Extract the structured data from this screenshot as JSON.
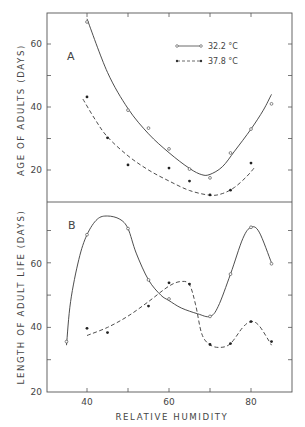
{
  "chart_data": [
    {
      "panel": "A",
      "type": "line",
      "title": "",
      "xlabel": "RELATIVE HUMIDITY",
      "ylabel": "AGE OF ADULTS (DAYS)",
      "ylim": [
        10,
        70
      ],
      "yticks": [
        20,
        30,
        40,
        50,
        60
      ],
      "ytick_labels": [
        "20",
        "",
        "40",
        "",
        "60"
      ],
      "legend_position": "upper right",
      "grid": false,
      "series": [
        {
          "name": "32.2 °C",
          "marker": "open-circle",
          "line": "solid",
          "points": [
            [
              40,
              67
            ],
            [
              50,
              39
            ],
            [
              55,
              33.3
            ],
            [
              60,
              26.7
            ],
            [
              65,
              20.3
            ],
            [
              70,
              17.5
            ],
            [
              75,
              25.4
            ],
            [
              80,
              33
            ],
            [
              85,
              41
            ]
          ],
          "curve": [
            [
              40,
              68
            ],
            [
              45,
              51
            ],
            [
              50,
              39.5
            ],
            [
              55,
              31.5
            ],
            [
              60,
              25.5
            ],
            [
              65,
              20.5
            ],
            [
              68,
              18.5
            ],
            [
              70,
              18.6
            ],
            [
              73,
              21
            ],
            [
              76,
              26
            ],
            [
              80,
              33
            ],
            [
              83,
              39
            ],
            [
              85,
              44
            ]
          ]
        },
        {
          "name": "37.8 °C",
          "marker": "filled-circle",
          "line": "dashed",
          "points": [
            [
              40,
              43.2
            ],
            [
              45,
              30.2
            ],
            [
              50,
              21.6
            ],
            [
              60,
              20.6
            ],
            [
              65,
              16.5
            ],
            [
              70,
              12.1
            ],
            [
              75,
              13.6
            ],
            [
              80,
              22.2
            ]
          ],
          "curve": [
            [
              39,
              42.5
            ],
            [
              42,
              36
            ],
            [
              45,
              30.5
            ],
            [
              50,
              24.5
            ],
            [
              55,
              20
            ],
            [
              60,
              16.5
            ],
            [
              65,
              13.5
            ],
            [
              70,
              12
            ],
            [
              73,
              12.5
            ],
            [
              76,
              14.5
            ],
            [
              79,
              18
            ],
            [
              81,
              21
            ]
          ]
        }
      ]
    },
    {
      "panel": "B",
      "type": "line",
      "title": "",
      "xlabel": "RELATIVE HUMIDITY",
      "ylabel": "LENGTH OF ADULT LIFE (DAYS)",
      "xlim": [
        30,
        90
      ],
      "xticks": [
        40,
        50,
        60,
        70,
        80
      ],
      "xtick_labels": [
        "40",
        "",
        "60",
        "",
        "80"
      ],
      "ylim": [
        20,
        79
      ],
      "yticks": [
        20,
        30,
        40,
        50,
        60,
        70
      ],
      "ytick_labels": [
        "20",
        "",
        "40",
        "",
        "60",
        ""
      ],
      "grid": false,
      "series": [
        {
          "name": "32.2 °C",
          "marker": "open-circle",
          "line": "solid",
          "points": [
            [
              35,
              35.6
            ],
            [
              40,
              68.7
            ],
            [
              50,
              70.6
            ],
            [
              55,
              54.7
            ],
            [
              60,
              48.8
            ],
            [
              70,
              43.4
            ],
            [
              75,
              56.5
            ],
            [
              80,
              71
            ],
            [
              85,
              59.7
            ]
          ],
          "curve": [
            [
              35,
              34.5
            ],
            [
              36,
              48
            ],
            [
              38,
              61
            ],
            [
              40,
              68.7
            ],
            [
              42.5,
              73.5
            ],
            [
              45,
              74.5
            ],
            [
              48,
              73.5
            ],
            [
              50,
              70.6
            ],
            [
              52,
              63
            ],
            [
              55,
              54.7
            ],
            [
              58,
              50
            ],
            [
              60,
              48.3
            ],
            [
              63,
              46
            ],
            [
              67,
              44.2
            ],
            [
              70,
              43.4
            ],
            [
              72,
              46.5
            ],
            [
              75,
              56.5
            ],
            [
              78,
              67.5
            ],
            [
              80,
              71
            ],
            [
              82,
              69.5
            ],
            [
              85,
              60
            ]
          ]
        },
        {
          "name": "37.8 °C",
          "marker": "filled-circle",
          "line": "dashed",
          "points": [
            [
              40,
              39.7
            ],
            [
              45,
              38.4
            ],
            [
              55,
              46.6
            ],
            [
              60,
              53.8
            ],
            [
              65,
              53.4
            ],
            [
              70,
              34.7
            ],
            [
              75,
              35
            ],
            [
              80,
              41.8
            ],
            [
              85,
              35.6
            ]
          ],
          "curve": [
            [
              40,
              37.5
            ],
            [
              45,
              40
            ],
            [
              50,
              43.5
            ],
            [
              55,
              48
            ],
            [
              60,
              52.8
            ],
            [
              63,
              54.2
            ],
            [
              65,
              53.2
            ],
            [
              66.5,
              47
            ],
            [
              68,
              38
            ],
            [
              70,
              34.6
            ],
            [
              72.5,
              33.8
            ],
            [
              75,
              35
            ],
            [
              78,
              40
            ],
            [
              80,
              41.8
            ],
            [
              82,
              40.5
            ],
            [
              85,
              34.5
            ]
          ]
        }
      ]
    }
  ],
  "labels": {
    "panel_a": "A",
    "panel_b": "B",
    "ylabel_a": "AGE OF ADULTS (DAYS)",
    "ylabel_b": "LENGTH OF ADULT LIFE (DAYS)",
    "xlabel": "RELATIVE HUMIDITY",
    "legend_solid": "32.2 °C",
    "legend_dashed": "37.8 °C",
    "ytick_a_60": "60",
    "ytick_a_40": "40",
    "ytick_a_20": "20",
    "ytick_b_60": "60",
    "ytick_b_40": "40",
    "ytick_b_20": "20",
    "xtick_40": "40",
    "xtick_60": "60",
    "xtick_80": "80"
  },
  "colors": {
    "ink": "#3a3a3a",
    "background": "#ffffff"
  }
}
